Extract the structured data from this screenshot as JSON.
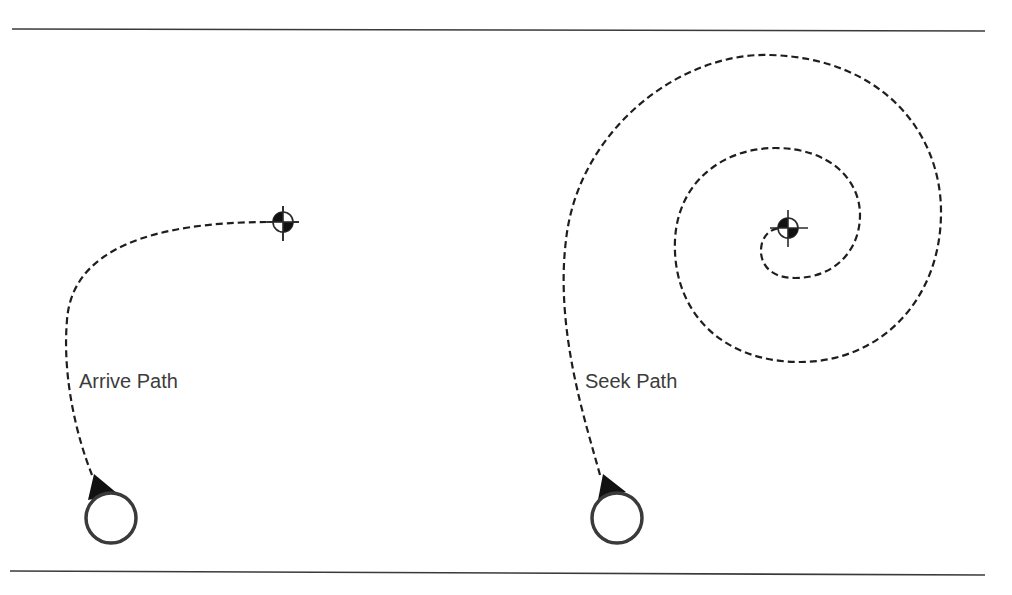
{
  "diagram": {
    "colors": {
      "line": "#1e1e1e",
      "label": "#3c3c3c",
      "background": "#ffffff"
    },
    "left": {
      "label": "Arrive Path",
      "agent": {
        "x": 111,
        "y": 518,
        "icon": "agent-circle-with-heading-icon"
      },
      "target": {
        "x": 283,
        "y": 222,
        "icon": "crosshair-target-icon"
      }
    },
    "right": {
      "label": "Seek Path",
      "agent": {
        "x": 617,
        "y": 518,
        "icon": "agent-circle-with-heading-icon"
      },
      "target": {
        "x": 788,
        "y": 228,
        "icon": "crosshair-target-icon"
      }
    }
  }
}
